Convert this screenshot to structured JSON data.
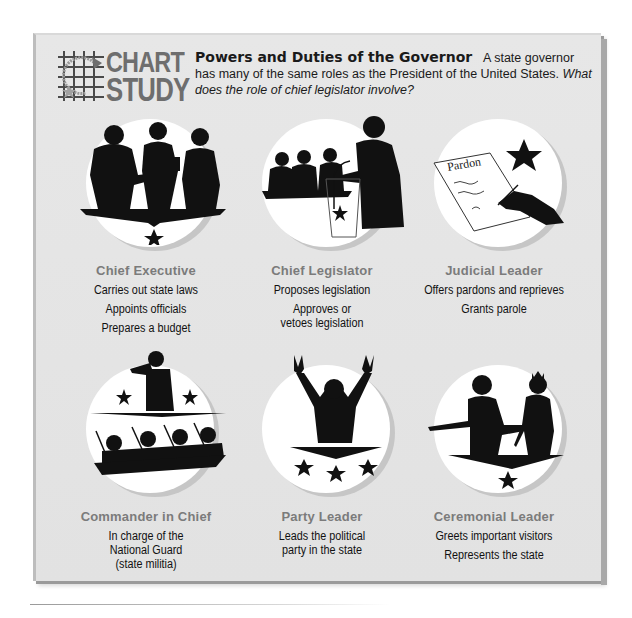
{
  "header": {
    "logo_line1": "CHART",
    "logo_line2": "STUDY",
    "title": "Powers and Duties of the Governor",
    "intro": "A state governor has many of the same roles as the President of the United States.",
    "question": "What does the role of chief legislator involve?"
  },
  "roles": [
    {
      "label": "Chief Executive",
      "icon": "executives-meeting-icon",
      "duties": [
        "Carries out state laws",
        "Appoints officials",
        "Prepares a budget"
      ]
    },
    {
      "label": "Chief Legislator",
      "icon": "podium-speaker-icon",
      "duties": [
        "Proposes legislation",
        "Approves or vetoes legislation"
      ]
    },
    {
      "label": "Judicial Leader",
      "icon": "pardon-document-icon",
      "pardon_text": "Pardon",
      "duties": [
        "Offers pardons and reprieves",
        "Grants parole"
      ]
    },
    {
      "label": "Commander in Chief",
      "icon": "saluting-soldiers-icon",
      "duties": [
        "In charge of the National Guard (state militia)"
      ]
    },
    {
      "label": "Party Leader",
      "icon": "victory-gesture-icon",
      "duties": [
        "Leads the political party in the state"
      ]
    },
    {
      "label": "Ceremonial Leader",
      "icon": "greeting-visitor-icon",
      "duties": [
        "Greets important visitors",
        "Represents the state"
      ]
    }
  ],
  "colors": {
    "panel_bg": "#e4e4e4",
    "role_label": "#7b7b7b",
    "text": "#111111",
    "silhouette": "#111111"
  }
}
